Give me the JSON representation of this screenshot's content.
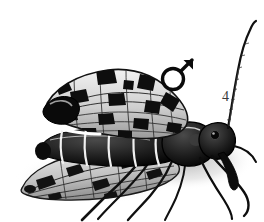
{
  "figure": {
    "number_label": "4",
    "sex_symbol_name": "male-symbol",
    "sex_symbol_glyph": "♂",
    "background_color": "#ffffff",
    "ink_color": "#111111",
    "shadow_color": "#b8b8b8",
    "midtone_color": "#6e6e6e"
  },
  "anatomy": {
    "antenna_label": "antenna",
    "head_label": "head",
    "rostrum_label": "rostrum",
    "thorax_label": "thorax",
    "abdomen_label": "abdomen",
    "forewing_label": "forewing",
    "hindwing_label": "hindwing",
    "foreleg_label": "foreleg",
    "midleg_label": "midleg",
    "hindleg_label": "hindleg"
  }
}
